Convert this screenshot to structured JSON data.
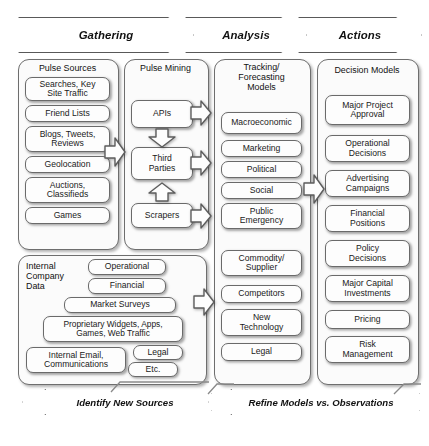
{
  "diagram": {
    "phases": [
      {
        "label": "Gathering",
        "name": "phase-gathering"
      },
      {
        "label": "Analysis",
        "name": "phase-analysis"
      },
      {
        "label": "Actions",
        "name": "phase-actions"
      }
    ],
    "columns": [
      {
        "id": "pulse-sources",
        "title": "Pulse Sources",
        "items": [
          "Searches, Key\nSite Traffic",
          "Friend Lists",
          "Blogs, Tweets,\nReviews",
          "Geolocation",
          "Auctions,\nClassifieds",
          "Games"
        ]
      },
      {
        "id": "internal-company-data",
        "title": "Internal\nCompany\nData",
        "items": [
          "Operational",
          "Financial",
          "Market Surveys",
          "Proprietary Widgets, Apps,\nGames, Web Traffic",
          "Internal Email,\nCommunications",
          "Legal",
          "Etc."
        ]
      },
      {
        "id": "pulse-mining",
        "title": "Pulse Mining",
        "items": [
          "APIs",
          "Third\nParties",
          "Scrapers"
        ]
      },
      {
        "id": "tracking-forecasting-models",
        "title": "Tracking/\nForecasting\nModels",
        "items": [
          "Macroeconomic",
          "Marketing",
          "Political",
          "Social",
          "Public\nEmergency",
          "Commodity/\nSupplier",
          "Competitors",
          "New\nTechnology",
          "Legal"
        ]
      },
      {
        "id": "decision-models",
        "title": "Decision Models",
        "items": [
          "Major Project\nApproval",
          "Operational\nDecisions",
          "Advertising\nCampaigns",
          "Financial\nPositions",
          "Policy\nDecisions",
          "Major Capital\nInvestments",
          "Pricing",
          "Risk\nManagement"
        ]
      }
    ],
    "feedback": [
      {
        "label": "Identify New Sources",
        "name": "feedback-identify-new-sources"
      },
      {
        "label": "Refine Models vs. Observations",
        "name": "feedback-refine-models"
      }
    ],
    "colors": {
      "background": "#ffffff",
      "box_fill": "#fdfdfd",
      "border": "#6a6a6a",
      "text": "#1a1a1a"
    }
  }
}
